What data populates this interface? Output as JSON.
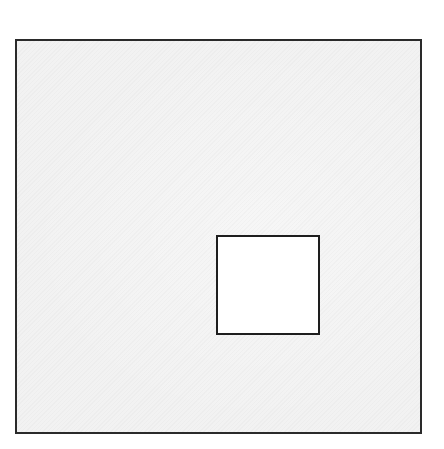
{
  "diagram": {
    "canvas": {
      "width": 444,
      "height": 449,
      "background": "#ffffff"
    },
    "outer_square": {
      "x": 15,
      "y": 39,
      "width": 407,
      "height": 395,
      "fill": "#f2f2f2",
      "stroke": "#2a2a2a"
    },
    "inner_square": {
      "x": 216,
      "y": 235,
      "width": 104,
      "height": 100,
      "fill": "#ffffff",
      "stroke": "#1e1e1e"
    }
  }
}
